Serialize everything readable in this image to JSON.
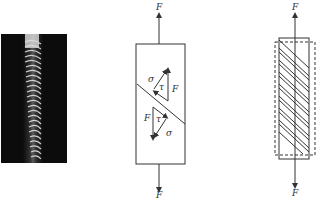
{
  "figure": {
    "panels": [
      {
        "id": "photo",
        "description": "Photograph of spiral/shear fracture band on specimen"
      },
      {
        "id": "stress-diagram",
        "labels": {
          "force_top": "F",
          "force_bottom": "F",
          "sigma_upper": "σ",
          "tau_upper": "τ",
          "force_upper": "F",
          "force_lower": "F",
          "tau_lower": "τ",
          "sigma_lower": "σ"
        }
      },
      {
        "id": "slip-diagram",
        "labels": {
          "force_top": "F",
          "force_bottom": "F"
        }
      }
    ]
  },
  "colors": {
    "line": "#333333",
    "photo_bg": "#0c0c0c",
    "band": "#e8e8e8"
  }
}
